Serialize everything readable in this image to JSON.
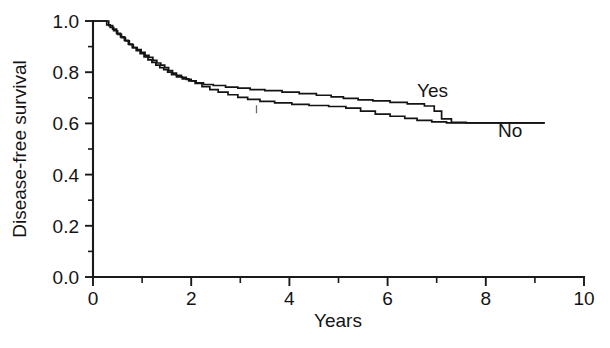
{
  "figure": {
    "background_color": "#ffffff",
    "ink_color": "#141414"
  },
  "chart_data": {
    "type": "line",
    "subtype": "kaplan-meier-step",
    "title": "",
    "subtitle": "",
    "xlabel": "Years",
    "ylabel": "Disease-free survival",
    "xlim": [
      0,
      10
    ],
    "ylim": [
      0.0,
      1.0
    ],
    "grid": false,
    "legend_position": "inline-right",
    "x_major_ticks": [
      0,
      2,
      4,
      6,
      8,
      10
    ],
    "x_major_tick_labels": [
      "0",
      "2",
      "4",
      "6",
      "8",
      "10"
    ],
    "x_minor_ticks": [
      1,
      3,
      5,
      7,
      9
    ],
    "y_major_ticks": [
      0.0,
      0.2,
      0.4,
      0.6,
      0.8,
      1.0
    ],
    "y_major_tick_labels": [
      "0.0",
      "0.2",
      "0.4",
      "0.6",
      "0.8",
      "1.0"
    ],
    "y_minor_ticks": [
      0.1,
      0.3,
      0.5,
      0.7,
      0.9
    ],
    "series": [
      {
        "name": "Yes",
        "label": "Yes",
        "label_x": 6.6,
        "label_y": 0.705,
        "points": [
          [
            0.0,
            1.0
          ],
          [
            0.22,
            1.0
          ],
          [
            0.28,
            0.985
          ],
          [
            0.35,
            0.975
          ],
          [
            0.42,
            0.962
          ],
          [
            0.5,
            0.948
          ],
          [
            0.58,
            0.935
          ],
          [
            0.66,
            0.922
          ],
          [
            0.74,
            0.908
          ],
          [
            0.82,
            0.896
          ],
          [
            0.9,
            0.888
          ],
          [
            0.98,
            0.878
          ],
          [
            1.06,
            0.866
          ],
          [
            1.14,
            0.858
          ],
          [
            1.22,
            0.846
          ],
          [
            1.3,
            0.836
          ],
          [
            1.38,
            0.828
          ],
          [
            1.46,
            0.818
          ],
          [
            1.54,
            0.806
          ],
          [
            1.62,
            0.796
          ],
          [
            1.7,
            0.788
          ],
          [
            1.8,
            0.78
          ],
          [
            1.9,
            0.772
          ],
          [
            2.0,
            0.766
          ],
          [
            2.1,
            0.758
          ],
          [
            2.25,
            0.752
          ],
          [
            2.45,
            0.748
          ],
          [
            2.7,
            0.742
          ],
          [
            2.95,
            0.738
          ],
          [
            3.2,
            0.732
          ],
          [
            3.5,
            0.728
          ],
          [
            3.85,
            0.722
          ],
          [
            4.2,
            0.716
          ],
          [
            4.55,
            0.71
          ],
          [
            4.85,
            0.704
          ],
          [
            5.1,
            0.698
          ],
          [
            5.4,
            0.692
          ],
          [
            5.7,
            0.688
          ],
          [
            6.05,
            0.682
          ],
          [
            6.4,
            0.676
          ],
          [
            6.75,
            0.668
          ],
          [
            6.95,
            0.648
          ],
          [
            7.1,
            0.618
          ],
          [
            7.3,
            0.604
          ],
          [
            7.6,
            0.602
          ],
          [
            9.2,
            0.602
          ]
        ]
      },
      {
        "name": "No",
        "label": "No",
        "label_x": 8.25,
        "label_y": 0.545,
        "points": [
          [
            0.0,
            1.0
          ],
          [
            0.25,
            1.0
          ],
          [
            0.32,
            0.982
          ],
          [
            0.4,
            0.968
          ],
          [
            0.48,
            0.952
          ],
          [
            0.56,
            0.938
          ],
          [
            0.64,
            0.924
          ],
          [
            0.72,
            0.91
          ],
          [
            0.8,
            0.896
          ],
          [
            0.88,
            0.884
          ],
          [
            0.96,
            0.872
          ],
          [
            1.04,
            0.86
          ],
          [
            1.12,
            0.848
          ],
          [
            1.2,
            0.838
          ],
          [
            1.28,
            0.828
          ],
          [
            1.36,
            0.818
          ],
          [
            1.44,
            0.81
          ],
          [
            1.52,
            0.8
          ],
          [
            1.6,
            0.79
          ],
          [
            1.7,
            0.782
          ],
          [
            1.82,
            0.774
          ],
          [
            1.95,
            0.766
          ],
          [
            2.08,
            0.756
          ],
          [
            2.22,
            0.744
          ],
          [
            2.38,
            0.732
          ],
          [
            2.55,
            0.722
          ],
          [
            2.75,
            0.712
          ],
          [
            2.95,
            0.702
          ],
          [
            3.15,
            0.694
          ],
          [
            3.4,
            0.686
          ],
          [
            3.7,
            0.68
          ],
          [
            4.05,
            0.674
          ],
          [
            4.4,
            0.67
          ],
          [
            4.8,
            0.666
          ],
          [
            5.15,
            0.66
          ],
          [
            5.45,
            0.648
          ],
          [
            5.75,
            0.636
          ],
          [
            6.05,
            0.628
          ],
          [
            6.35,
            0.62
          ],
          [
            6.6,
            0.612
          ],
          [
            6.9,
            0.606
          ],
          [
            7.2,
            0.602
          ],
          [
            9.2,
            0.602
          ]
        ]
      }
    ],
    "censoring_marks": [
      {
        "x": 3.33,
        "y": 0.655,
        "series": "No"
      }
    ],
    "annotations": []
  }
}
